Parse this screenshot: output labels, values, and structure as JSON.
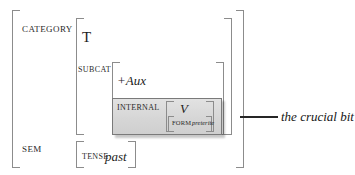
{
  "diagram": {
    "kind": "attribute-value-matrix",
    "outer_structure": {
      "attributes": [
        {
          "name": "CATEGORY",
          "label": "CATEGORY",
          "value_head": "T",
          "subattributes": [
            {
              "name": "SUBCAT",
              "label": "SUBCAT",
              "value_head": "+Aux",
              "subattributes": [
                {
                  "name": "INTERNAL",
                  "label": "INTERNAL",
                  "value_head": "V",
                  "subattributes": [
                    {
                      "name": "FORM",
                      "label": "FORM",
                      "value_head": "preterite",
                      "subattributes": []
                    }
                  ]
                }
              ]
            }
          ]
        },
        {
          "name": "SEM",
          "label": "SEM",
          "value_head": "",
          "subattributes": [
            {
              "name": "TENSE",
              "label": "TENSE",
              "value_head": "past",
              "subattributes": []
            }
          ]
        }
      ]
    },
    "annotation": {
      "text": "the crucial bit",
      "connector": "horizontal-line"
    },
    "colors": {
      "bracket": "#8c8c8c",
      "text": "#1c1c1c",
      "highlight_fill": "#d8d8d8",
      "highlight_border": "#7a7a7a",
      "connector": "#262626",
      "background": "#ffffff"
    }
  }
}
